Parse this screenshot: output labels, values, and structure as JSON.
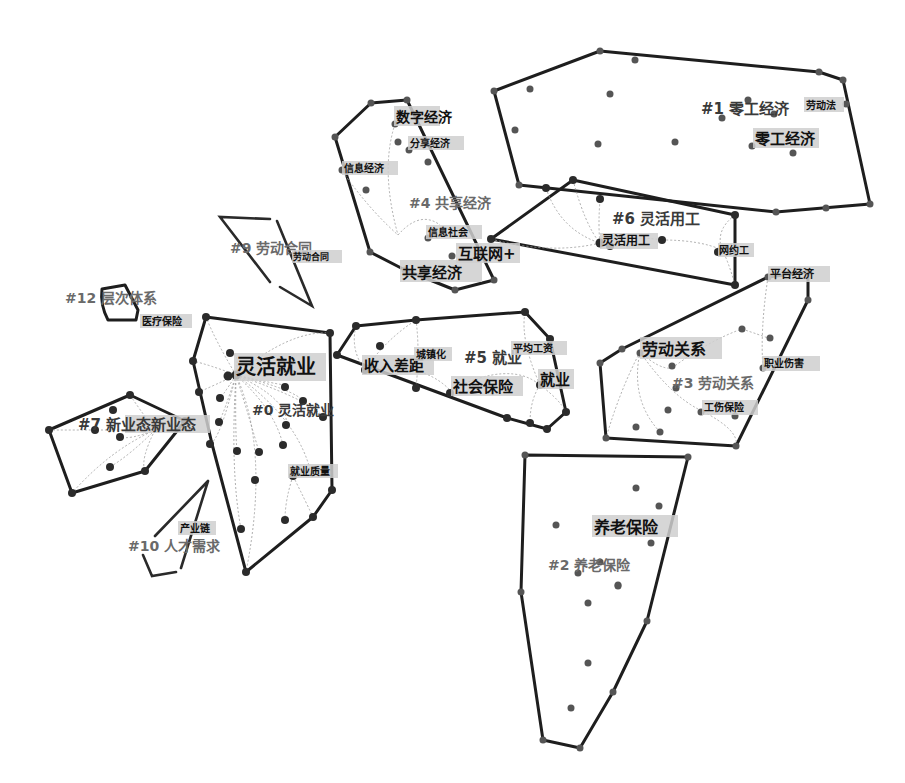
{
  "diagram": {
    "type": "keyword-cluster-map",
    "clusters": [
      {
        "id": "#0",
        "label": "#0 灵活就业",
        "keywords": [
          "灵活就业",
          "就业质量"
        ]
      },
      {
        "id": "#1",
        "label": "#1 零工经济",
        "keywords": [
          "零工经济",
          "劳动法"
        ]
      },
      {
        "id": "#2",
        "label": "#2 养老保险",
        "keywords": [
          "养老保险"
        ]
      },
      {
        "id": "#3",
        "label": "#3 劳动关系",
        "keywords": [
          "劳动关系",
          "平台经济",
          "职业伤害",
          "工伤保险"
        ]
      },
      {
        "id": "#4",
        "label": "#4 共享经济",
        "keywords": [
          "数字经济",
          "分享经济",
          "信息经济",
          "信息社会",
          "互联网+",
          "共享经济"
        ]
      },
      {
        "id": "#5",
        "label": "#5 就业",
        "keywords": [
          "收入差距",
          "城镇化",
          "平均工资",
          "社会保险",
          "就业"
        ]
      },
      {
        "id": "#6",
        "label": "#6 灵活用工",
        "keywords": [
          "灵活用工",
          "网约工"
        ]
      },
      {
        "id": "#7",
        "label": "#7 新业态新业态",
        "keywords": []
      },
      {
        "id": "#9",
        "label": "#9 劳动合同",
        "keywords": [
          "劳动合同"
        ]
      },
      {
        "id": "#10",
        "label": "#10 人才需求",
        "keywords": [
          "产业链"
        ]
      },
      {
        "id": "#12",
        "label": "#12 层次体系",
        "keywords": [
          "医疗保险"
        ]
      }
    ],
    "labels": {
      "c0": "#0 灵活就业",
      "c1": "#1 零工经济",
      "c2": "#2 养老保险",
      "c3": "#3 劳动关系",
      "c4": "#4 共享经济",
      "c5": "#5 就业",
      "c6": "#6 灵活用工",
      "c7": "#7 新业态新业态",
      "c9": "#9 劳动合同",
      "c10": "#10 人才需求",
      "c12": "#12 层次体系"
    },
    "keywords": {
      "linghuojiuye": "灵活就业",
      "jiuyezhiliang": "就业质量",
      "linggongjingji": "零工经济",
      "laodongfa": "劳动法",
      "yanglaobaoxian": "养老保险",
      "laodongguanxi": "劳动关系",
      "pingtaijingji": "平台经济",
      "zhiyeshanghai": "职业伤害",
      "gongshangbaoxian": "工伤保险",
      "shuzijingji": "数字经济",
      "fenxiangjingji": "分享经济",
      "xinxijingji": "信息经济",
      "xinxishehui": "信息社会",
      "hulianwang": "互联网+",
      "gongxiangjingji": "共享经济",
      "shouruchaju": "收入差距",
      "chengzhenhua": "城镇化",
      "pingjungongzi": "平均工资",
      "shehuibaoxian": "社会保险",
      "jiuye": "就业",
      "linghuoyonggong": "灵活用工",
      "wangyuegong": "网约工",
      "laodonghetong": "劳动合同",
      "chanyelian": "产业链",
      "yiliaobaoxian": "医疗保险"
    }
  }
}
